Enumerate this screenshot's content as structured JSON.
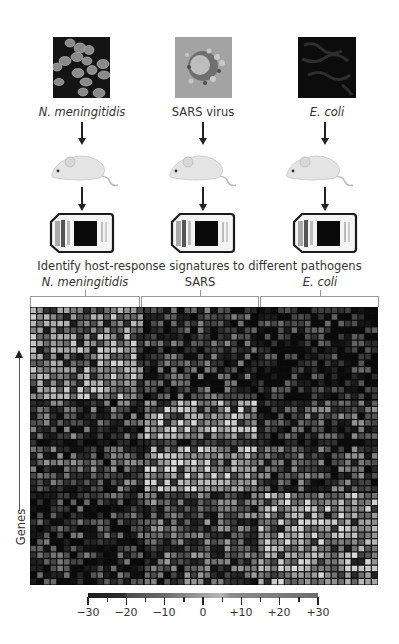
{
  "pathogens": [
    {
      "name": "N. meningitidis",
      "italic": true,
      "thumb_style": "bacteria"
    },
    {
      "name": "SARS virus",
      "italic": false,
      "thumb_style": "virus"
    },
    {
      "name": "E. coli",
      "italic": true,
      "thumb_style": "ecoli"
    }
  ],
  "icons": {
    "host": "mouse-icon",
    "assay": "microarray-chip-icon"
  },
  "title": "Identify host-response signatures to different pathogens",
  "heatmap_groups": [
    {
      "label": "N. meningitidis",
      "italic": true
    },
    {
      "label": "SARS",
      "italic": false
    },
    {
      "label": "E. coli",
      "italic": true
    }
  ],
  "y_axis_label": "Genes",
  "colorbar": {
    "ticks": [
      "−30",
      "−20",
      "−10",
      "0",
      "+10",
      "+20",
      "+30"
    ],
    "min": -30,
    "max": 30
  },
  "chart_data": {
    "type": "heatmap",
    "title": "Identify host-response signatures to different pathogens",
    "xlabel": "",
    "ylabel": "Genes",
    "column_groups": [
      "N. meningitidis",
      "SARS",
      "E. coli"
    ],
    "row_blocks": [
      "gene cluster 1 (top)",
      "gene cluster 2 (middle)",
      "gene cluster 3 (bottom)"
    ],
    "grid": {
      "rows": 42,
      "cols": 52,
      "cols_per_group": [
        17,
        17,
        18
      ],
      "rows_per_block": [
        14,
        14,
        14
      ]
    },
    "block_mean_brightness": [
      [
        0.55,
        0.25,
        0.15
      ],
      [
        0.3,
        0.65,
        0.3
      ],
      [
        0.22,
        0.35,
        0.62
      ]
    ],
    "colorbar_range": [
      -30,
      30
    ],
    "colorbar_ticks": [
      -30,
      -20,
      -10,
      0,
      10,
      20,
      30
    ]
  }
}
